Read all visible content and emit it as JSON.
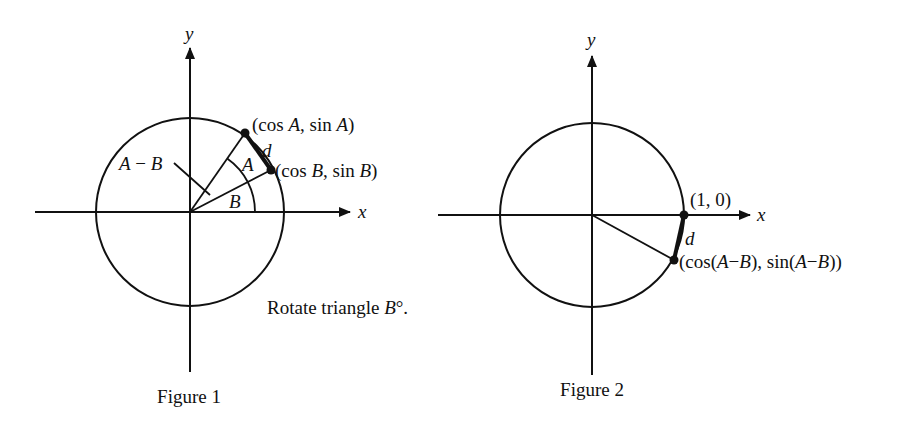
{
  "figure1": {
    "caption": "Figure 1",
    "x_axis_label": "x",
    "y_axis_label": "y",
    "point_a_label": "(cos A, sin A)",
    "point_a": {
      "open": "(cos ",
      "v1": "A",
      "mid": ", sin ",
      "v2": "A",
      "close": ")"
    },
    "point_b": {
      "open": "(cos ",
      "v1": "B",
      "mid": ", sin ",
      "v2": "B",
      "close": ")"
    },
    "chord_label": "d",
    "angle_a_label": "A",
    "angle_b_label": "B",
    "difference_label": {
      "a": "A",
      "minus": " − ",
      "b": "B"
    },
    "note": {
      "text": "Rotate triangle ",
      "var": "B",
      "suffix": "°."
    }
  },
  "figure2": {
    "caption": "Figure 2",
    "x_axis_label": "x",
    "y_axis_label": "y",
    "point_one_label": "(1, 0)",
    "chord_label": "d",
    "point_diff": {
      "p1": "(cos(",
      "a1": "A",
      "m1": "−",
      "b1": "B",
      "p2": "), sin(",
      "a2": "A",
      "m2": "−",
      "b2": "B",
      "p3": "))"
    }
  },
  "colors": {
    "ink": "#111111",
    "background": "#ffffff"
  }
}
